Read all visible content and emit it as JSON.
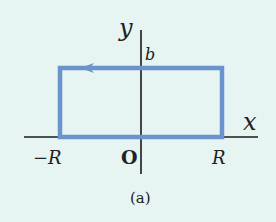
{
  "diagram": {
    "caption": "(a)",
    "axes": {
      "x_label": "x",
      "y_label": "y",
      "origin_label": "O"
    },
    "tick_labels": {
      "neg_R": "−R",
      "pos_R": "R",
      "b": "b"
    },
    "path": {
      "shape": "rectangle",
      "corners": [
        "(-R,0)",
        "(R,0)",
        "(R,b)",
        "(-R,b)"
      ],
      "direction": "counterclockwise",
      "arrow_position": "top edge, pointing left",
      "color": "#6b93cd"
    },
    "colors": {
      "background": "#e6f5f1",
      "axis": "#1a1a1a",
      "path": "#6b93cd"
    }
  }
}
